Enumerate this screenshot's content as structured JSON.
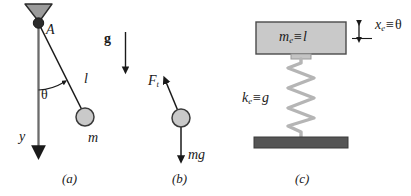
{
  "figure": {
    "type": "physics-diagram",
    "background_color": "#ffffff",
    "ink_color": "#1a1a1a"
  },
  "colors": {
    "line": "#1a1a1a",
    "bob_fill": "#c9c9c9",
    "bob_stroke": "#3a3a3a",
    "pivot_fill": "#2b2b2b",
    "bracket_fill": "#9b9b9b",
    "bracket_stroke": "#2b2b2b",
    "block_fill": "#c9c9c9",
    "block_stroke": "#4a4a4a",
    "spring_color": "#b5b5b5",
    "ground_fill": "#555555",
    "rod_color": "#6b6b6b"
  },
  "panels": [
    {
      "id": "a",
      "label": "(a)",
      "name": "pendulum-panel",
      "elements": {
        "pivot_label": "A",
        "angle_label": "θ",
        "length_label": "l",
        "mass_label": "m",
        "axis_label": "y",
        "gravity_label": "g"
      }
    },
    {
      "id": "b",
      "label": "(b)",
      "name": "free-body-diagram-panel",
      "elements": {
        "tension_force_symbol": "F",
        "tension_force_subscript": "t",
        "weight_label": "mg"
      }
    },
    {
      "id": "c",
      "label": "(c)",
      "name": "mass-spring-analog-panel",
      "elements": {
        "mass_symbol": "m",
        "mass_subscript": "e",
        "mass_equivalence": "≡",
        "mass_equivalent_to": "l",
        "stiffness_symbol": "k",
        "stiffness_subscript": "e",
        "stiffness_equivalence": "≡",
        "stiffness_equivalent_to": "g",
        "displacement_symbol": "x",
        "displacement_subscript": "e",
        "displacement_equivalence": "≡",
        "displacement_equivalent_to": "θ"
      }
    }
  ],
  "geometry": {
    "pendulum": {
      "pivot_x": 38,
      "pivot_y": 23,
      "bob_x": 85,
      "bob_y": 117,
      "bob_radius": 9,
      "vertical_axis_end_y": 150,
      "angle_degrees": 27
    },
    "fbd": {
      "bob_x": 181,
      "bob_y": 118,
      "bob_radius": 9,
      "tension_tip_x": 164,
      "tension_tip_y": 80,
      "weight_tip_y": 160
    },
    "oscillator": {
      "block_x": 256,
      "block_y": 22,
      "block_w": 90,
      "block_h": 32,
      "spring_top_y": 58,
      "spring_bottom_y": 137,
      "spring_center_x": 301,
      "spring_coils": 8,
      "ground_x": 254,
      "ground_y": 137,
      "ground_w": 94,
      "ground_h": 11
    }
  }
}
